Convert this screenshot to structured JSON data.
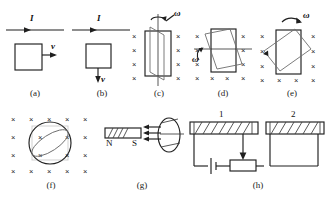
{
  "figure": {
    "background": "#ffffff",
    "ink": "#1f1f1f",
    "field_marker": "×",
    "panels": [
      {
        "id": "a",
        "caption": "(a)",
        "description": "straight current-carrying wire above a rectangular loop moving to the right",
        "labels": [
          {
            "name": "current-label",
            "text": "I"
          },
          {
            "name": "velocity-label",
            "text": "v"
          }
        ]
      },
      {
        "id": "b",
        "caption": "(b)",
        "description": "straight current-carrying wire above a rectangular loop moving downward",
        "labels": [
          {
            "name": "current-label",
            "text": "I"
          },
          {
            "name": "velocity-label",
            "text": "v"
          }
        ]
      },
      {
        "id": "c",
        "caption": "(c)",
        "description": "rectangular loop rotating about a vertical axis in a field into the page",
        "labels": [
          {
            "name": "angular-velocity-label",
            "text": "ω"
          }
        ]
      },
      {
        "id": "d",
        "caption": "(d)",
        "description": "rectangular loop rotating about a horizontal axis in a field into the page",
        "labels": [
          {
            "name": "angular-velocity-label",
            "text": "ω"
          }
        ]
      },
      {
        "id": "e",
        "caption": "(e)",
        "description": "rectangular loop rotating in its own plane about its centre in a field into the page",
        "labels": [
          {
            "name": "angular-velocity-label",
            "text": "ω"
          }
        ]
      },
      {
        "id": "f",
        "caption": "(f)",
        "description": "circular loop being tilted (shown as an ellipse) in a field into the page",
        "labels": []
      },
      {
        "id": "g",
        "caption": "(g)",
        "description": "bar magnet with north and south poles producing flux through a circular coil",
        "labels": [
          {
            "name": "north-pole-label",
            "text": "N"
          },
          {
            "name": "south-pole-label",
            "text": "S"
          }
        ]
      },
      {
        "id": "h",
        "caption": "(h)",
        "description": "solenoid 1 driven by a battery and rheostat, coupled to neighbouring solenoid 2",
        "labels": [
          {
            "name": "coil-one-label",
            "text": "1"
          },
          {
            "name": "coil-two-label",
            "text": "2"
          }
        ]
      }
    ]
  }
}
